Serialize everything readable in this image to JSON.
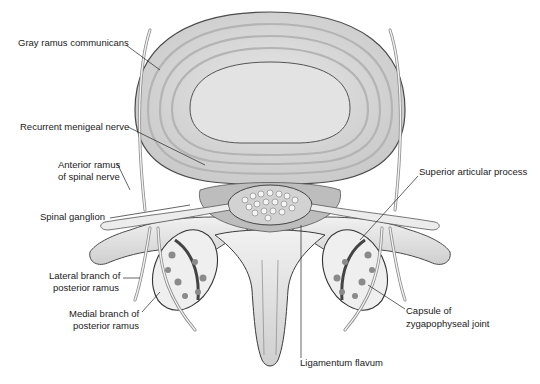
{
  "figure": {
    "style": "grayscale medical illustration",
    "labels": {
      "gray_ramus": "Gray ramus communicans",
      "recurrent_meningeal": "Recurrent menigeal nerve",
      "anterior_ramus_1": "Anterior ramus",
      "anterior_ramus_2": "of spinal nerve",
      "spinal_ganglion": "Spinal ganglion",
      "lateral_branch_1": "Lateral branch of",
      "lateral_branch_2": "posterior ramus",
      "medial_branch_1": "Medial branch of",
      "medial_branch_2": "posterior ramus",
      "superior_articular": "Superior articular process",
      "capsule_1": "Capsule of",
      "capsule_2": "zygapophyseal joint",
      "ligamentum_flavum": "Ligamentum flavum"
    },
    "caption": ""
  },
  "colors": {
    "background": "#ffffff",
    "disc_ring": "#d9d9d9",
    "nucleus": "#e4e4e4",
    "outline": "#4a4a4a",
    "bone": "#e8e8e8",
    "leader": "#222222"
  }
}
